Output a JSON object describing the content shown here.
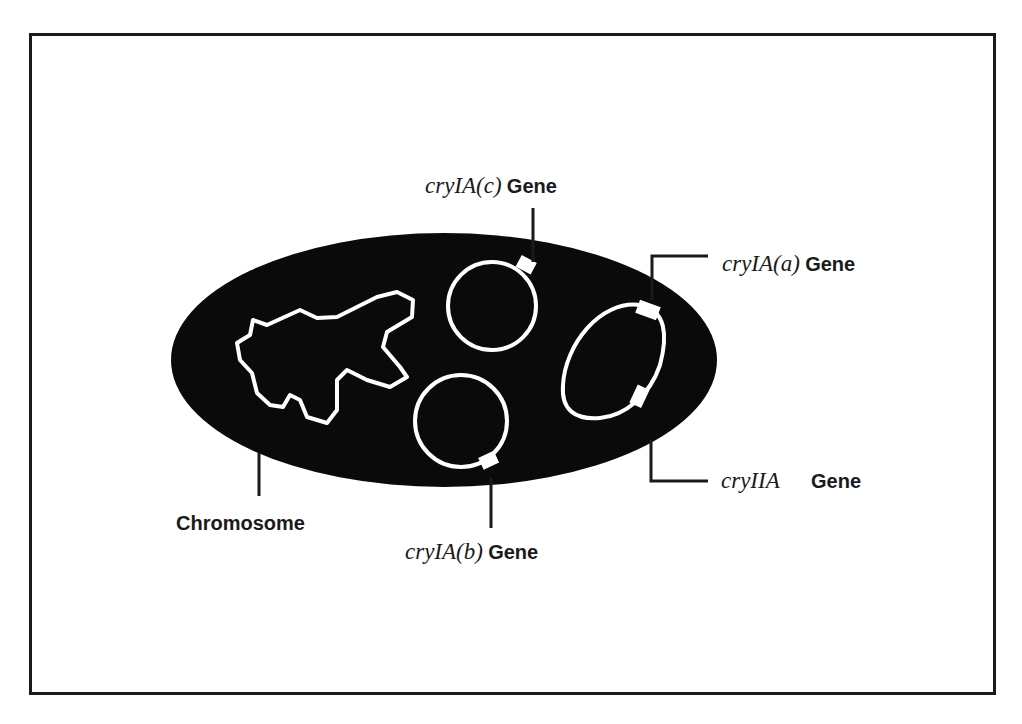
{
  "diagram": {
    "title": "",
    "type": "bacterial cell with chromosome and plasmids",
    "colors": {
      "cell_fill": "#0a0a0a",
      "dna_stroke": "#ffffff",
      "leader_lines": "#1a1a1a",
      "frame": "#1a1a1a",
      "background": "#ffffff"
    },
    "labels": {
      "chromosome": "Chromosome",
      "cry1ac": {
        "name": "cryIA(c)",
        "suffix": "Gene"
      },
      "cry1aa": {
        "name": "cryIA(a)",
        "suffix": "Gene"
      },
      "cry2a": {
        "name": "cryIIA",
        "suffix": "Gene"
      },
      "cry1ab": {
        "name": "cryIA(b)",
        "suffix": "Gene"
      }
    },
    "nodes": [
      {
        "id": "cell",
        "shape": "ellipse",
        "role": "bacterial cell"
      },
      {
        "id": "chromosome",
        "shape": "irregular loop",
        "label": "Chromosome"
      },
      {
        "id": "plasmid-c",
        "shape": "circle",
        "gene": "cryIA(c) Gene"
      },
      {
        "id": "plasmid-b",
        "shape": "circle",
        "gene": "cryIA(b) Gene"
      },
      {
        "id": "plasmid-a-iia",
        "shape": "oval",
        "genes": [
          "cryIA(a) Gene",
          "cryIIA Gene"
        ]
      }
    ]
  }
}
